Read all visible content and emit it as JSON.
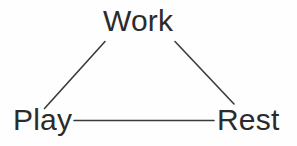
{
  "diagram": {
    "background_color": "#fefefe",
    "line_color": "#3a3a3a",
    "text_color": "#2b2b2b",
    "nodes": [
      {
        "id": "work",
        "label": "Work",
        "position": "top"
      },
      {
        "id": "play",
        "label": "Play",
        "position": "bottom-left"
      },
      {
        "id": "rest",
        "label": "Rest",
        "position": "bottom-right"
      }
    ],
    "edges": [
      {
        "id": "work-play",
        "from": "Work",
        "to": "Play",
        "style": "straight-line"
      },
      {
        "id": "work-rest",
        "from": "Work",
        "to": "Rest",
        "style": "straight-line"
      },
      {
        "id": "play-rest",
        "from": "Play",
        "to": "Rest",
        "style": "straight-line"
      }
    ]
  }
}
